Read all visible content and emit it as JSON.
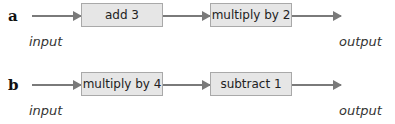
{
  "diagrams": [
    {
      "label": "a",
      "input_label": "input",
      "output_label": "output",
      "steps": [
        "add 3",
        "multiply by 2"
      ]
    },
    {
      "label": "b",
      "input_label": "input",
      "output_label": "output",
      "steps": [
        "multiply by 4",
        "subtract 1"
      ]
    }
  ],
  "colors": {
    "box_fill": "#e6e6e6",
    "box_border": "#a9a9a9",
    "arrow": "#7a7a7a"
  }
}
